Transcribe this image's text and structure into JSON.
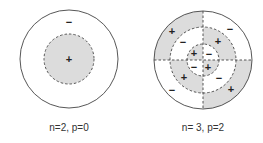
{
  "colors": {
    "shade": "#dcdcdc",
    "stroke": "#444444",
    "background": "#ffffff"
  },
  "diagrams": [
    {
      "label": "n=2, p=0",
      "signs": [
        {
          "text": "−",
          "region": "outer-ring"
        },
        {
          "text": "+",
          "region": "inner-disk"
        }
      ]
    },
    {
      "label": "n= 3, p=2",
      "signs": [
        {
          "text": "+",
          "region": "outer-ring-top-left"
        },
        {
          "text": "−",
          "region": "outer-ring-top-right"
        },
        {
          "text": "−",
          "region": "middle-ring-top-left"
        },
        {
          "text": "+",
          "region": "middle-ring-top-right"
        },
        {
          "text": "+",
          "region": "inner-disk-top-left"
        },
        {
          "text": "−",
          "region": "inner-disk-top-right"
        },
        {
          "text": "−",
          "region": "inner-disk-bottom-left"
        },
        {
          "text": "+",
          "region": "inner-disk-bottom-right"
        },
        {
          "text": "+",
          "region": "middle-ring-bottom-left"
        },
        {
          "text": "−",
          "region": "middle-ring-bottom-right"
        },
        {
          "text": "−",
          "region": "outer-ring-bottom-left"
        },
        {
          "text": "+",
          "region": "outer-ring-bottom-right"
        }
      ]
    }
  ]
}
